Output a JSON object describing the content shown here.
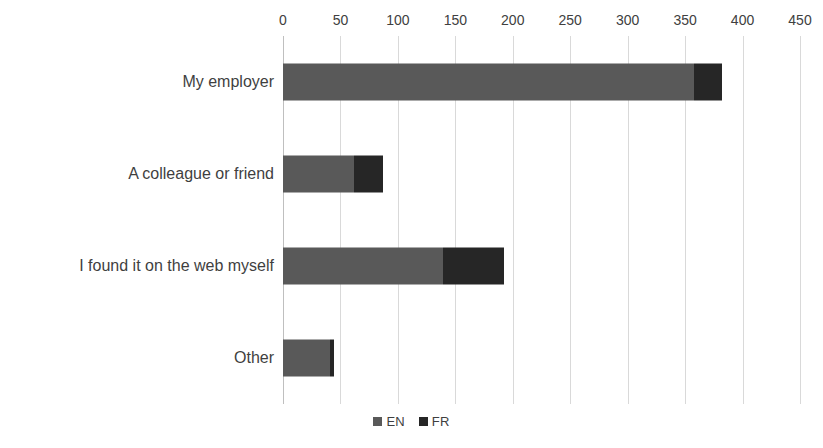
{
  "chart_data": {
    "type": "bar",
    "orientation": "horizontal",
    "stacked": true,
    "title": "",
    "subtitle": "",
    "xlabel": "",
    "ylabel": "",
    "xlim": [
      0,
      450
    ],
    "xticks": [
      0,
      50,
      100,
      150,
      200,
      250,
      300,
      350,
      400,
      450
    ],
    "grid": "vertical",
    "legend_position": "bottom",
    "categories": [
      "My employer",
      "A colleague or friend",
      "I found it on the web myself",
      "Other"
    ],
    "series": [
      {
        "name": "EN",
        "color": "#595959",
        "values": [
          358,
          62,
          139,
          41
        ]
      },
      {
        "name": "FR",
        "color": "#262626",
        "values": [
          24,
          25,
          53,
          3
        ]
      }
    ],
    "totals": [
      382,
      87,
      192,
      44
    ]
  },
  "axis": {
    "ticks": [
      "0",
      "50",
      "100",
      "150",
      "200",
      "250",
      "300",
      "350",
      "400",
      "450"
    ]
  },
  "legend": {
    "items": [
      {
        "label": "EN",
        "color": "#595959"
      },
      {
        "label": "FR",
        "color": "#262626"
      }
    ]
  },
  "colors": {
    "en": "#595959",
    "fr": "#262626",
    "grid": "#d9d9d9",
    "text": "#3f3f3f",
    "background": "#ffffff"
  }
}
